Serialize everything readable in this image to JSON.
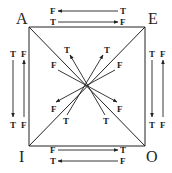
{
  "diagram": {
    "corners": {
      "A": {
        "label": "A",
        "x": 29,
        "y": 27
      },
      "E": {
        "label": "E",
        "x": 145,
        "y": 27
      },
      "I": {
        "label": "I",
        "x": 29,
        "y": 146
      },
      "O": {
        "label": "O",
        "x": 145,
        "y": 146
      }
    },
    "edges": [
      {
        "from": "A",
        "to": "E"
      },
      {
        "from": "A",
        "to": "I"
      },
      {
        "from": "E",
        "to": "O"
      },
      {
        "from": "I",
        "to": "O"
      },
      {
        "from": "A",
        "to": "O"
      },
      {
        "from": "E",
        "to": "I"
      }
    ],
    "labels": {
      "top_upper": {
        "left": "F",
        "right": "T"
      },
      "top_lower": {
        "left": "T",
        "right": "F"
      },
      "bottom_upper": {
        "left": "F",
        "right": "T"
      },
      "bottom_lower": {
        "left": "T",
        "right": "F"
      },
      "left_outer": {
        "top": "T",
        "bottom": "T"
      },
      "left_inner": {
        "top": "F",
        "bottom": "F"
      },
      "right_inner": {
        "top": "T",
        "bottom": "T"
      },
      "right_outer": {
        "top": "F",
        "bottom": "F"
      },
      "diag_ao_1": {
        "start": "T",
        "end": "T"
      },
      "diag_ao_2": {
        "start": "F",
        "end": "F"
      },
      "diag_ei_1": {
        "start": "T",
        "end": "T"
      },
      "diag_ei_2": {
        "start": "F",
        "end": "F"
      }
    },
    "relations": [
      {
        "name": "contraries",
        "between": [
          "A",
          "E"
        ],
        "rule": "A true → E false; E true → A false"
      },
      {
        "name": "subcontraries",
        "between": [
          "I",
          "O"
        ],
        "rule": "I false → O true; O false → I true"
      },
      {
        "name": "subalternation",
        "between": [
          "A",
          "I"
        ],
        "rule": "A true → I true; I false → A false"
      },
      {
        "name": "subalternation",
        "between": [
          "E",
          "O"
        ],
        "rule": "E true → O true; O false → E false"
      },
      {
        "name": "contradictories",
        "between": [
          "A",
          "O"
        ],
        "rule": "T → F, F → T"
      },
      {
        "name": "contradictories",
        "between": [
          "E",
          "I"
        ],
        "rule": "T → F, F → T"
      }
    ]
  }
}
